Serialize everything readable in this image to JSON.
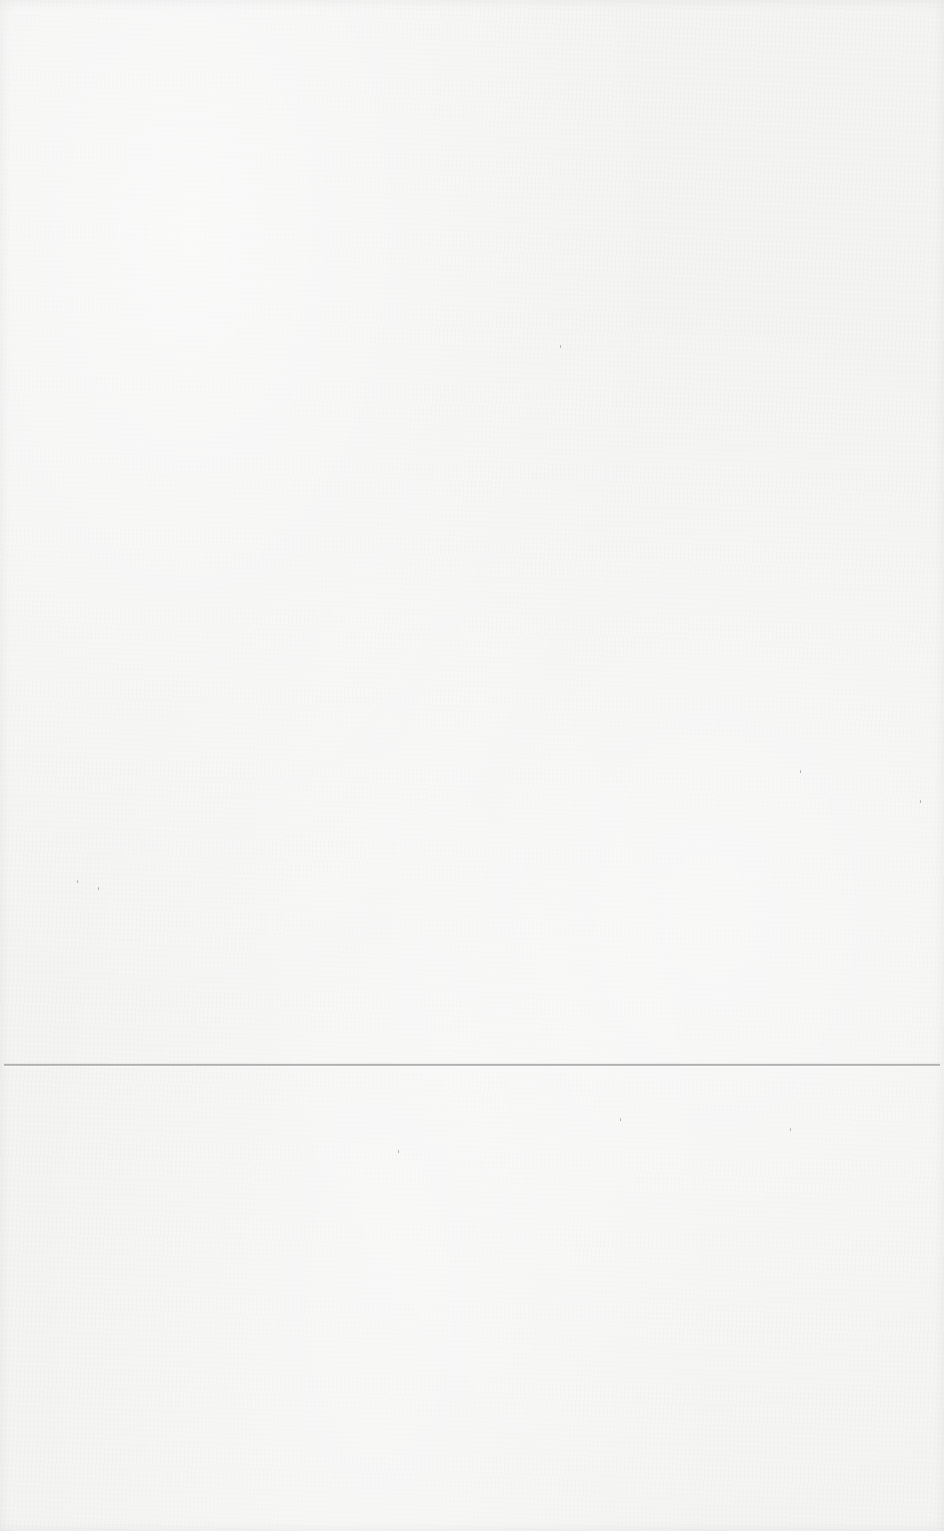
{
  "page": {
    "background_color": "#f4f4f3",
    "fold_line": {
      "y": 1064,
      "color": "#a9a9a9"
    },
    "specks": [
      {
        "x": 620,
        "y": 1118
      },
      {
        "x": 790,
        "y": 1128
      },
      {
        "x": 920,
        "y": 800
      },
      {
        "x": 77,
        "y": 880
      },
      {
        "x": 98,
        "y": 887
      },
      {
        "x": 560,
        "y": 345
      },
      {
        "x": 398,
        "y": 1150
      },
      {
        "x": 800,
        "y": 770
      }
    ]
  }
}
